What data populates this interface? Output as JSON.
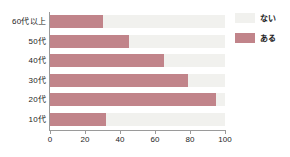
{
  "chart_data": {
    "type": "bar",
    "orientation": "horizontal",
    "stacked": true,
    "title": "",
    "xlabel": "",
    "ylabel": "",
    "xlim": [
      0,
      100
    ],
    "xticks": [
      0,
      20,
      40,
      60,
      80,
      100
    ],
    "grid": false,
    "legend_position": "right",
    "categories": [
      "60代以上",
      "50代",
      "40代",
      "30代",
      "20代",
      "10代"
    ],
    "series": [
      {
        "name": "ある",
        "color": "#c1848a",
        "values": [
          30,
          45,
          65,
          79,
          95,
          32
        ]
      },
      {
        "name": "ない",
        "color": "#f1f1ee",
        "values": [
          70,
          55,
          35,
          21,
          5,
          68
        ]
      }
    ]
  },
  "legend": {
    "items": [
      {
        "label": "ない",
        "swatch": "none-swatch"
      },
      {
        "label": "ある",
        "swatch": "have-swatch"
      }
    ]
  },
  "axis": {
    "x_tick_labels": [
      "0",
      "20",
      "40",
      "60",
      "80",
      "100"
    ],
    "y_tick_labels": [
      "60代以上",
      "50代",
      "40代",
      "30代",
      "20代",
      "10代"
    ]
  }
}
